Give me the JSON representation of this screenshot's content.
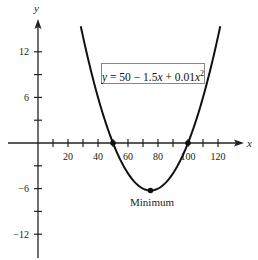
{
  "chart_data": {
    "type": "line",
    "title": "",
    "equation": "y = 50 − 1.5x + 0.01x²",
    "equation_parts": {
      "lhs": "y",
      "rhs": " = 50 − 1.5",
      "x1": "x",
      "mid": " + 0.01",
      "x2": "x",
      "exp": "2"
    },
    "xlabel": "x",
    "ylabel": "y",
    "xlim": [
      -20,
      130
    ],
    "ylim": [
      -15,
      17
    ],
    "x_ticks": [
      10,
      20,
      30,
      40,
      50,
      60,
      70,
      80,
      90,
      100,
      110,
      120
    ],
    "x_tick_labels": [
      "20",
      "40",
      "60",
      "80",
      "100",
      "120"
    ],
    "x_tick_label_values": [
      20,
      40,
      60,
      80,
      100,
      120
    ],
    "y_ticks": [
      -12,
      -9,
      -6,
      -3,
      3,
      6,
      9,
      12
    ],
    "y_tick_labels": [
      "12",
      "6",
      "−6",
      "−12"
    ],
    "y_tick_label_values": [
      12,
      6,
      -6,
      -12
    ],
    "series": [
      {
        "name": "y = 50 - 1.5x + 0.01x^2",
        "x": [
          30,
          40,
          50,
          60,
          70,
          75,
          80,
          90,
          100,
          110,
          120
        ],
        "y": [
          14,
          6,
          0,
          -4,
          -6,
          -6.25,
          -6,
          -4,
          0,
          6,
          14
        ]
      }
    ],
    "points": [
      {
        "x": 50,
        "y": 0,
        "label": ""
      },
      {
        "x": 100,
        "y": 0,
        "label": ""
      },
      {
        "x": 75,
        "y": -6.25,
        "label": "Minimum"
      }
    ],
    "annotations": [
      "Minimum"
    ],
    "grid": false,
    "legend": "none"
  }
}
